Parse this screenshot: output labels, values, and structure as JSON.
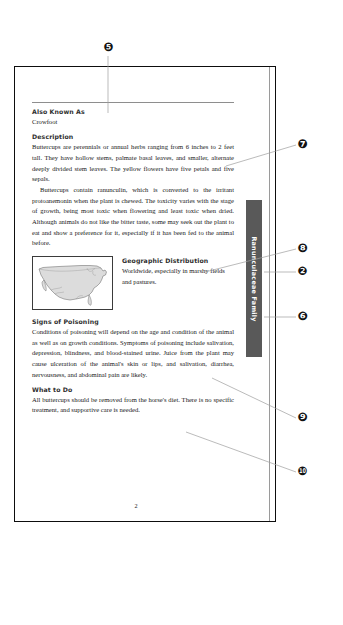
{
  "document": {
    "page_number": "2",
    "side_tab_label": "Ranunculaceae Family"
  },
  "sections": [
    {
      "heading": "Also Known As",
      "body": "Crowfoot"
    },
    {
      "heading": "Description",
      "body": "Buttercups are perennials or annual herbs ranging from 6 inches to 2 feet tall. They have hollow stems, palmate basal leaves, and smaller, alternate deeply divided stem leaves. The yellow flowers have five petals and five sepals.",
      "body2": "Buttercups contain ranunculin, which is converted to the irritant protoanemonin when the plant is chewed. The toxicity varies with the stage of growth, being most toxic when flowering and least toxic when dried. Although animals do not like the bitter taste, some may seek out the plant to eat and show a preference for it, especially if it has been fed to the animal before."
    },
    {
      "heading": "Geographic Distribution",
      "body": "Worldwide, especially in marshy fields and pastures."
    },
    {
      "heading": "Signs of Poisoning",
      "body": "Conditions of poisoning will depend on the age and condition of the animal as well as on growth conditions. Symptoms of poisoning include salivation, depression, blindness, and blood-stained urine. Juice from the plant may cause ulceration of the animal's skin or lips, and salivation, diarrhea, nervousness, and abdominal pain are likely."
    },
    {
      "heading": "What to Do",
      "body": "All buttercups should be removed from the horse's diet. There is no specific treatment, and supportive care is needed."
    }
  ],
  "map": {
    "alt_name": "united-states-map"
  },
  "callouts": [
    {
      "id": "marker-5",
      "label": "❶\u0000",
      "glyph": "⑤"
    },
    {
      "id": "marker-7",
      "glyph": "⑦"
    },
    {
      "id": "marker-8",
      "glyph": "⑧"
    },
    {
      "id": "marker-2",
      "glyph": "②"
    },
    {
      "id": "marker-6",
      "glyph": "⑥"
    },
    {
      "id": "marker-9",
      "glyph": "⑨"
    },
    {
      "id": "marker-10",
      "glyph": "⑩"
    }
  ],
  "markers": {
    "m5": "5",
    "m7": "7",
    "m8": "8",
    "m2": "2",
    "m6": "6",
    "m9": "9",
    "m10": "10"
  },
  "colors": {
    "tab_background": "#595959",
    "tab_text": "#ffffff",
    "marker_background": "#111111",
    "marker_text": "#ffffff",
    "page_border": "#0d0d0d",
    "leader_line": "#9d9d9d"
  }
}
